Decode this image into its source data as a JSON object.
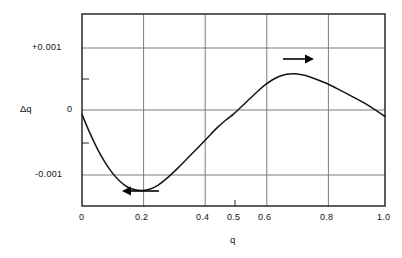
{
  "chart_data": {
    "type": "line",
    "title": "",
    "xlabel": "q",
    "ylabel": "Δq",
    "xlim": [
      0,
      1.0
    ],
    "ylim": [
      -0.00135,
      0.00148
    ],
    "grid": true,
    "legend": null,
    "x_ticks": [
      {
        "value": 0,
        "label": "0"
      },
      {
        "value": 0.2,
        "label": "0.2"
      },
      {
        "value": 0.4,
        "label": "0.4"
      },
      {
        "value": 0.5,
        "label": "0.5"
      },
      {
        "value": 0.6,
        "label": "0.6"
      },
      {
        "value": 0.8,
        "label": "0.8"
      },
      {
        "value": 1.0,
        "label": "1.0"
      }
    ],
    "x_gridlines": [
      0.2,
      0.4,
      0.6,
      0.8
    ],
    "y_ticks": [
      {
        "value": 0.001,
        "label": "+0.001",
        "grid": true
      },
      {
        "value": 0.0005,
        "label": "",
        "grid": false
      },
      {
        "value": 0,
        "label": "0",
        "grid": true
      },
      {
        "value": -0.0005,
        "label": "",
        "grid": false
      },
      {
        "value": -0.001,
        "label": "-0.001",
        "grid": true
      }
    ],
    "series": [
      {
        "name": "delta-q",
        "x": [
          0.0,
          0.025,
          0.05,
          0.075,
          0.1,
          0.125,
          0.15,
          0.175,
          0.2,
          0.225,
          0.25,
          0.275,
          0.3,
          0.325,
          0.35,
          0.375,
          0.4,
          0.425,
          0.45,
          0.475,
          0.5,
          0.525,
          0.55,
          0.575,
          0.6,
          0.625,
          0.65,
          0.675,
          0.7,
          0.725,
          0.75,
          0.8,
          0.85,
          0.9,
          0.95,
          1.0
        ],
        "y": [
          0.0,
          -0.000265,
          -0.0005,
          -0.0007,
          -0.000862,
          -0.000985,
          -0.00107,
          -0.001112,
          -0.001122,
          -0.0011,
          -0.001045,
          -0.000962,
          -0.000862,
          -0.000752,
          -0.00064,
          -0.000525,
          -0.00041,
          -0.000292,
          -0.00018,
          -8.2e-05,
          5e-06,
          0.00011,
          0.000215,
          0.00032,
          0.00042,
          0.0005,
          0.000558,
          0.000592,
          0.0006,
          0.000585,
          0.000555,
          0.00047,
          0.000362,
          0.000245,
          0.00012,
          -3e-05
        ]
      }
    ],
    "annotations": [
      {
        "name": "right-arrow",
        "direction": "right",
        "x_start": 0.66,
        "x_end": 0.75,
        "y": 0.00076
      },
      {
        "name": "left-arrow",
        "direction": "left",
        "x_start": 0.32,
        "x_end": 0.2,
        "y": -0.0013
      }
    ]
  }
}
